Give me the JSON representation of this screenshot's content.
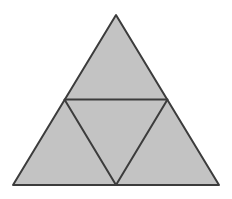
{
  "figure": {
    "canvas": {
      "width": "232",
      "height": "199",
      "viewbox": "0 0 232 199",
      "background": "#ffffff"
    },
    "style": {
      "fill_color": "#c3c3c3",
      "stroke_color": "#3c3c3c",
      "stroke_width": "2"
    },
    "outer_triangle": {
      "points": "116,15 13,185 219,185",
      "apex": "116,15",
      "bottom_left": "13,185",
      "bottom_right": "219,185"
    },
    "inner_triangle": {
      "points": "64.5,99.5 167.5,99.5 116,185",
      "left_midpoint": "64.5,99.5",
      "right_midpoint": "167.5,99.5",
      "bottom_midpoint": "116,185"
    }
  }
}
